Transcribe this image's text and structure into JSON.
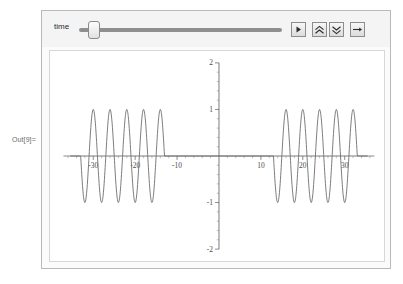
{
  "output_label": "Out[9]=",
  "panel": {
    "control": {
      "slider": {
        "name": "time",
        "label": "time",
        "value": 4.5,
        "min": 0,
        "max": 100,
        "thumb_percent": 4.5
      },
      "buttons": [
        {
          "id": "play",
          "label": "▶",
          "icon": "play-icon",
          "tooltip": "Play animation"
        },
        {
          "id": "faster",
          "label": "«",
          "icon": "double-chevron-up-icon",
          "tooltip": "Increase animation speed"
        },
        {
          "id": "slower",
          "label": "»",
          "icon": "double-chevron-down-icon",
          "tooltip": "Decrease animation speed"
        },
        {
          "id": "step",
          "label": "→",
          "icon": "arrow-right-icon",
          "tooltip": "Step forward"
        }
      ]
    }
  },
  "colors": {
    "panel_border": "#b9b9b9",
    "control_background": "#f4f4f4",
    "plot_background": "#ffffff",
    "curve": "#6d6d6d",
    "axis": "#5a5a5a"
  },
  "chart_data": {
    "type": "line",
    "title": "",
    "xlabel": "",
    "ylabel": "",
    "xlim": [
      -37,
      37
    ],
    "ylim": [
      -2,
      2
    ],
    "grid": false,
    "legend": null,
    "xticks": [
      -30,
      -20,
      -10,
      10,
      20,
      30
    ],
    "xtick_labels": [
      "-30",
      "-20",
      "-10",
      "10",
      "20",
      "30"
    ],
    "yticks": [
      -2,
      -1,
      1,
      2
    ],
    "ytick_labels": [
      "-2",
      "-1",
      "1",
      "2"
    ],
    "x_minor_tick_step": 2,
    "y_minor_tick_step": 0.2,
    "series": [
      {
        "name": "wave",
        "amplitude": 1,
        "period": 4,
        "packets": [
          {
            "x_start": -33,
            "x_end": -13,
            "cycles": 5
          },
          {
            "x_start": 13,
            "x_end": 33,
            "cycles": 5
          }
        ],
        "zero_regions": [
          {
            "x_start": -37,
            "x_end": -33
          },
          {
            "x_start": -13,
            "x_end": 13
          },
          {
            "x_start": 33,
            "x_end": 37
          }
        ]
      }
    ]
  }
}
